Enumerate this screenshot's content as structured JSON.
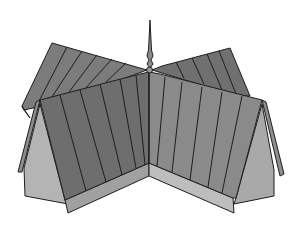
{
  "image": {
    "subject": "Cross-gabled roof illustration with central spire",
    "alt_text": "Line illustration of two intersecting gabled roofs with standing-seam panels and a pointed finial at the crossing"
  },
  "palette": {
    "background": "#ffffff",
    "roof_front_left": "#6e6e6e",
    "roof_front_right": "#8a8a8a",
    "roof_back_left": "#7c7c7c",
    "roof_back_right": "#707070",
    "gable_wall_left": "#b4b4b4",
    "gable_wall_right": "#a9a9a9",
    "base_band_left": "#a0a0a0",
    "base_band_right": "#bdbdbd",
    "outline": "#1e1e1e",
    "spire": "#8c8c8c"
  }
}
